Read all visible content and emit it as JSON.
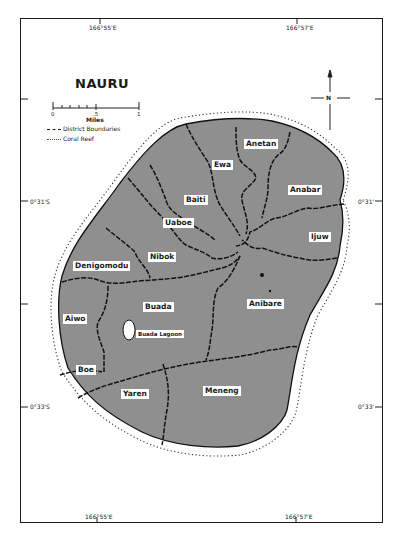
{
  "map": {
    "title": "NAURU",
    "coordinates": {
      "top": [
        "166°55'E",
        "166°57'E"
      ],
      "bottom": [
        "166°55'E",
        "166°57'E"
      ],
      "left": [
        "0°31'S",
        "0°33'S"
      ],
      "right": [
        "0°31'",
        "0°33'"
      ]
    },
    "scale": {
      "ticks": [
        "0",
        ".5",
        "1"
      ],
      "unit": "Miles"
    },
    "legend": [
      {
        "symbol": "dashed-line",
        "label": "District Boundaries"
      },
      {
        "symbol": "dotted-line",
        "label": "Coral Reef"
      }
    ],
    "compass": {
      "label": "N"
    },
    "districts": [
      {
        "name": "Anetan"
      },
      {
        "name": "Ewa"
      },
      {
        "name": "Anabar"
      },
      {
        "name": "Baiti"
      },
      {
        "name": "Uaboe"
      },
      {
        "name": "Ijuw"
      },
      {
        "name": "Nibok"
      },
      {
        "name": "Denigomodu"
      },
      {
        "name": "Anibare"
      },
      {
        "name": "Buada"
      },
      {
        "name": "Aiwo"
      },
      {
        "name": "Boe"
      },
      {
        "name": "Yaren"
      },
      {
        "name": "Meneng"
      }
    ],
    "features": [
      {
        "name": "Buada Lagoon"
      }
    ],
    "colors": {
      "land": "#8f8f8f",
      "boundary": "#111111",
      "background": "#ffffff"
    }
  }
}
